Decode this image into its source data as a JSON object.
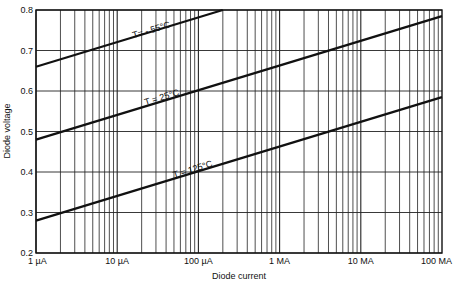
{
  "chart_data": {
    "type": "line",
    "title": "",
    "xlabel": "Diode current",
    "ylabel": "Diode voltage",
    "xscale": "log",
    "x_tick_labels": [
      "1 µA",
      "10 µA",
      "100 µA",
      "1 MA",
      "10 MA",
      "100 MA"
    ],
    "y_ticks": [
      0.2,
      0.3,
      0.4,
      0.5,
      0.6,
      0.7,
      0.8
    ],
    "y_tick_labels": [
      "0.2",
      "0.3",
      "0.4",
      "0.5",
      "0.6",
      "0.7",
      "0.8"
    ],
    "ylim": [
      0.2,
      0.8
    ],
    "xlim_decades": [
      0,
      5
    ],
    "grid": true,
    "series": [
      {
        "name": "T = -55°C",
        "label": "T= - 55°C",
        "x_decades": [
          0,
          2.3
        ],
        "values": [
          0.66,
          0.8
        ],
        "label_pos": {
          "decade": 1.2,
          "v": 0.73
        }
      },
      {
        "name": "T = 25°C",
        "label": "T = 25°C",
        "x_decades": [
          0,
          5
        ],
        "values": [
          0.48,
          0.785
        ],
        "label_pos": {
          "decade": 1.35,
          "v": 0.565
        }
      },
      {
        "name": "T = 125°C",
        "label": "T = 125°C",
        "x_decades": [
          0,
          5
        ],
        "values": [
          0.28,
          0.585
        ],
        "label_pos": {
          "decade": 1.7,
          "v": 0.385
        }
      }
    ]
  },
  "colors": {
    "ink": "#111111",
    "grid": "#222222",
    "background": "#ffffff"
  }
}
